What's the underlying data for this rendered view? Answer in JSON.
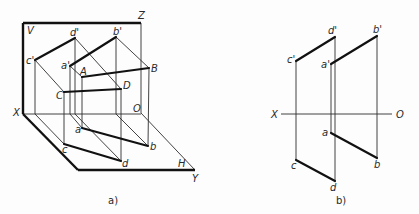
{
  "figure_a": {
    "caption": "a)",
    "caption_pos": [
      108,
      204
    ],
    "frame_thick": [
      [
        [
          23,
          23
        ],
        [
          141,
          23
        ]
      ],
      [
        [
          23,
          23
        ],
        [
          23,
          114
        ]
      ],
      [
        [
          23,
          114
        ],
        [
          78,
          170
        ]
      ],
      [
        [
          78,
          170
        ],
        [
          195,
          170
        ]
      ]
    ],
    "frame_thin": [
      [
        [
          141,
          23
        ],
        [
          141,
          113
        ]
      ],
      [
        [
          23,
          114
        ],
        [
          141,
          114
        ]
      ],
      [
        [
          141,
          113
        ],
        [
          195,
          170
        ]
      ]
    ],
    "object_thick": [
      [
        [
          35,
          60
        ],
        [
          75,
          38
        ]
      ],
      [
        [
          70,
          66
        ],
        [
          116,
          37
        ]
      ],
      [
        [
          64,
          144
        ],
        [
          121,
          161
        ]
      ],
      [
        [
          82,
          128
        ],
        [
          148,
          146
        ]
      ],
      [
        [
          64,
          92
        ],
        [
          121,
          89
        ]
      ],
      [
        [
          82,
          77
        ],
        [
          149,
          68
        ]
      ]
    ],
    "projectors_thin": [
      [
        [
          35,
          60
        ],
        [
          35,
          114
        ]
      ],
      [
        [
          35,
          114
        ],
        [
          64,
          144
        ]
      ],
      [
        [
          35,
          60
        ],
        [
          64,
          92
        ]
      ],
      [
        [
          64,
          92
        ],
        [
          64,
          144
        ]
      ],
      [
        [
          75,
          38
        ],
        [
          75,
          114
        ]
      ],
      [
        [
          75,
          38
        ],
        [
          121,
          89
        ]
      ],
      [
        [
          121,
          89
        ],
        [
          121,
          161
        ]
      ],
      [
        [
          75,
          114
        ],
        [
          121,
          161
        ]
      ],
      [
        [
          70,
          66
        ],
        [
          70,
          114
        ]
      ],
      [
        [
          70,
          66
        ],
        [
          82,
          77
        ]
      ],
      [
        [
          82,
          77
        ],
        [
          82,
          128
        ]
      ],
      [
        [
          70,
          114
        ],
        [
          82,
          128
        ]
      ],
      [
        [
          116,
          37
        ],
        [
          116,
          114
        ]
      ],
      [
        [
          116,
          37
        ],
        [
          149,
          68
        ]
      ],
      [
        [
          149,
          68
        ],
        [
          148,
          146
        ]
      ],
      [
        [
          116,
          114
        ],
        [
          148,
          146
        ]
      ]
    ],
    "labels": [
      {
        "text": "V",
        "x": 27,
        "y": 34
      },
      {
        "text": "Z",
        "x": 138,
        "y": 19
      },
      {
        "text": "d'",
        "x": 70,
        "y": 36
      },
      {
        "text": "b'",
        "x": 113,
        "y": 35
      },
      {
        "text": "c'",
        "x": 26,
        "y": 64
      },
      {
        "text": "a'",
        "x": 61,
        "y": 69
      },
      {
        "text": "A",
        "x": 80,
        "y": 75
      },
      {
        "text": "B",
        "x": 151,
        "y": 72
      },
      {
        "text": "D",
        "x": 123,
        "y": 89
      },
      {
        "text": "C",
        "x": 56,
        "y": 99
      },
      {
        "text": "O",
        "x": 133,
        "y": 112
      },
      {
        "text": "X",
        "x": 13,
        "y": 116
      },
      {
        "text": "a",
        "x": 75,
        "y": 133
      },
      {
        "text": "b",
        "x": 150,
        "y": 150
      },
      {
        "text": "c",
        "x": 62,
        "y": 153
      },
      {
        "text": "d",
        "x": 122,
        "y": 167
      },
      {
        "text": "H",
        "x": 178,
        "y": 167
      },
      {
        "text": "Y",
        "x": 192,
        "y": 182
      }
    ]
  },
  "figure_b": {
    "caption": "b)",
    "caption_pos": [
      336,
      204
    ],
    "axis": [
      [
        281,
        114
      ],
      [
        392,
        114
      ]
    ],
    "object_thick": [
      [
        [
          296,
          61
        ],
        [
          335,
          37
        ]
      ],
      [
        [
          331,
          64
        ],
        [
          377,
          36
        ]
      ],
      [
        [
          296,
          160
        ],
        [
          335,
          181
        ]
      ],
      [
        [
          331,
          133
        ],
        [
          377,
          158
        ]
      ]
    ],
    "projectors_thin": [
      [
        [
          296,
          61
        ],
        [
          296,
          160
        ]
      ],
      [
        [
          335,
          37
        ],
        [
          335,
          181
        ]
      ],
      [
        [
          331,
          64
        ],
        [
          331,
          133
        ]
      ],
      [
        [
          377,
          36
        ],
        [
          377,
          158
        ]
      ]
    ],
    "labels": [
      {
        "text": "d'",
        "x": 328,
        "y": 34
      },
      {
        "text": "b'",
        "x": 373,
        "y": 33
      },
      {
        "text": "c'",
        "x": 287,
        "y": 63
      },
      {
        "text": "a'",
        "x": 321,
        "y": 68
      },
      {
        "text": "X",
        "x": 271,
        "y": 118
      },
      {
        "text": "O",
        "x": 396,
        "y": 118
      },
      {
        "text": "a",
        "x": 322,
        "y": 136
      },
      {
        "text": "b",
        "x": 374,
        "y": 168
      },
      {
        "text": "c",
        "x": 291,
        "y": 169
      },
      {
        "text": "d",
        "x": 330,
        "y": 191
      }
    ]
  }
}
